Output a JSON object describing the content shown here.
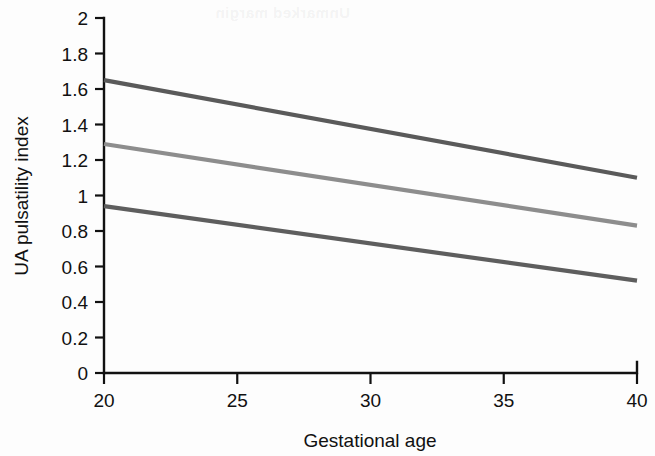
{
  "figure": {
    "background_color": "#fdfdfd",
    "ghost_text": "Unmarked margin"
  },
  "chart_data": {
    "type": "line",
    "title": "",
    "xlabel": "Gestational age",
    "ylabel": "UA pulsatility index",
    "xlim": [
      20,
      40
    ],
    "ylim": [
      0,
      2
    ],
    "x": [
      20,
      40
    ],
    "xticks": [
      20,
      25,
      30,
      35,
      40
    ],
    "xtick_labels": [
      "20",
      "25",
      "30",
      "35",
      "40"
    ],
    "yticks": [
      0,
      0.2,
      0.4,
      0.6,
      0.8,
      1,
      1.2,
      1.4,
      1.6,
      1.8,
      2
    ],
    "ytick_labels": [
      "0",
      "0.2",
      "0.4",
      "0.6",
      "0.8",
      "1",
      "1.2",
      "1.4",
      "1.6",
      "1.8",
      "2"
    ],
    "grid": false,
    "legend": "none",
    "series": [
      {
        "name": "upper-centile",
        "color": "#5a5a5a",
        "values": [
          1.65,
          1.1
        ]
      },
      {
        "name": "median-centile",
        "color": "#8d8d8d",
        "values": [
          1.29,
          0.83
        ]
      },
      {
        "name": "lower-centile",
        "color": "#5e5e5e",
        "values": [
          0.94,
          0.52
        ]
      }
    ]
  }
}
